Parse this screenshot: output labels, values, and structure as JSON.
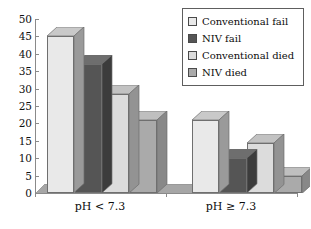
{
  "chart_data": {
    "type": "bar",
    "title": "",
    "subtitle": "",
    "xlabel": "",
    "ylabel": "",
    "categories": [
      "pH < 7.3",
      "pH ≥ 7.3"
    ],
    "series": [
      {
        "name": "Conventional  fail",
        "values": [
          45,
          21
        ],
        "color": "#e9e9e9"
      },
      {
        "name": "NIV fail",
        "values": [
          37,
          10
        ],
        "color": "#555555"
      },
      {
        "name": "Conventional died",
        "values": [
          28.5,
          14.5
        ],
        "color": "#dcdcdc"
      },
      {
        "name": "NIV died",
        "values": [
          21,
          5
        ],
        "color": "#aaaaaa"
      }
    ],
    "ylim": [
      0,
      50
    ],
    "yticks": [
      0,
      5,
      10,
      15,
      20,
      25,
      30,
      35,
      40,
      45,
      50
    ],
    "ytick_labels": [
      "0",
      "5",
      "10",
      "15",
      "20",
      "25",
      "30",
      "35",
      "40",
      "45",
      "50"
    ],
    "grid": false,
    "legend_position": "top-right",
    "three_d": true
  },
  "legend": {
    "items": [
      {
        "label": "Conventional  fail"
      },
      {
        "label": "NIV fail"
      },
      {
        "label": "Conventional died"
      },
      {
        "label": "NIV died"
      }
    ]
  },
  "axes": {
    "y_tick_labels": [
      "50",
      "45",
      "40",
      "35",
      "30",
      "25",
      "20",
      "15",
      "10",
      "5",
      "0"
    ],
    "x_group_labels": [
      "pH < 7.3",
      "pH ≥ 7.3"
    ]
  },
  "colors": {
    "series_1_front": "#e9e9e9",
    "series_1_top": "#c9c9c9",
    "series_1_side": "#9a9a9a",
    "series_2_front": "#555555",
    "series_2_top": "#6e6e6e",
    "series_2_side": "#3c3c3c",
    "series_3_front": "#dcdcdc",
    "series_3_top": "#c2c2c2",
    "series_3_side": "#939393",
    "series_4_front": "#aaaaaa",
    "series_4_top": "#bfbfbf",
    "series_4_side": "#888888",
    "axis": "#8a8a8a",
    "text": "#0c0c0c",
    "floor": "#a6a6a6",
    "background": "#ffffff"
  }
}
